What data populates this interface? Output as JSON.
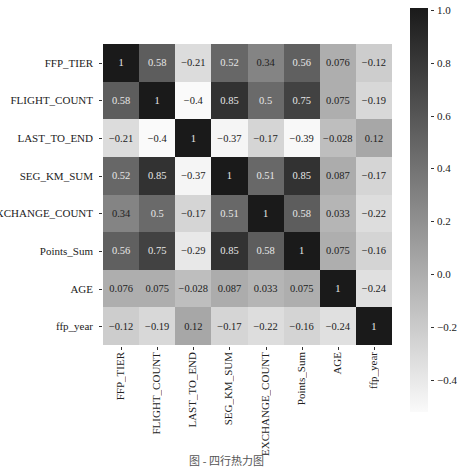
{
  "chart_data": {
    "type": "heatmap",
    "title": "",
    "xlabel": "",
    "ylabel": "",
    "labels": [
      "FFP_TIER",
      "FLIGHT_COUNT",
      "LAST_TO_END",
      "SEG_KM_SUM",
      "EXCHANGE_COUNT",
      "Points_Sum",
      "AGE",
      "ffp_year"
    ],
    "matrix": [
      [
        1,
        0.58,
        -0.21,
        0.52,
        0.34,
        0.56,
        0.076,
        -0.12
      ],
      [
        0.58,
        1,
        -0.4,
        0.85,
        0.5,
        0.75,
        0.075,
        -0.19
      ],
      [
        -0.21,
        -0.4,
        1,
        -0.37,
        -0.17,
        -0.39,
        -0.028,
        0.12
      ],
      [
        0.52,
        0.85,
        -0.37,
        1,
        0.51,
        0.85,
        0.087,
        -0.17
      ],
      [
        0.34,
        0.5,
        -0.17,
        0.51,
        1,
        0.58,
        0.033,
        -0.22
      ],
      [
        0.56,
        0.75,
        -0.29,
        0.85,
        0.58,
        1,
        0.075,
        -0.16
      ],
      [
        0.076,
        0.075,
        -0.028,
        0.087,
        0.033,
        0.075,
        1,
        -0.24
      ],
      [
        -0.12,
        -0.19,
        0.12,
        -0.17,
        -0.22,
        -0.16,
        -0.24,
        1
      ]
    ],
    "cell_text": [
      [
        "1",
        "0.58",
        "−0.21",
        "0.52",
        "0.34",
        "0.56",
        "0.076",
        "−0.12"
      ],
      [
        "0.58",
        "1",
        "−0.4",
        "0.85",
        "0.5",
        "0.75",
        "0.075",
        "−0.19"
      ],
      [
        "−0.21",
        "−0.4",
        "1",
        "−0.37",
        "−0.17",
        "−0.39",
        "−0.028",
        "0.12"
      ],
      [
        "0.52",
        "0.85",
        "−0.37",
        "1",
        "0.51",
        "0.85",
        "0.087",
        "−0.17"
      ],
      [
        "0.34",
        "0.5",
        "−0.17",
        "0.51",
        "1",
        "0.58",
        "0.033",
        "−0.22"
      ],
      [
        "0.56",
        "0.75",
        "−0.29",
        "0.85",
        "0.58",
        "1",
        "0.075",
        "−0.16"
      ],
      [
        "0.076",
        "0.075",
        "−0.028",
        "0.087",
        "0.033",
        "0.075",
        "1",
        "−0.24"
      ],
      [
        "−0.12",
        "−0.19",
        "0.12",
        "−0.17",
        "−0.22",
        "−0.16",
        "−0.24",
        "1"
      ]
    ],
    "colorbar": {
      "vmin": -0.4,
      "vmax": 1.0,
      "ticks": [
        "1.0",
        "0.8",
        "0.6",
        "0.4",
        "0.2",
        "0.0",
        "−0.2",
        "−0.4"
      ],
      "colormap": "greys",
      "low_color": "#fafafa",
      "high_color": "#1a1a1a"
    },
    "annotations": true,
    "grid": false,
    "legend_position": "right (colorbar)"
  },
  "caption": "图 - 四行热力图"
}
